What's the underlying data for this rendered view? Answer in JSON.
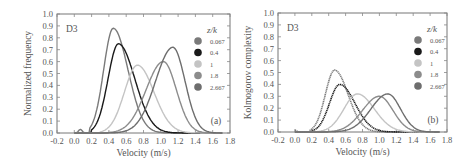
{
  "figure": {
    "panels_count": 2
  },
  "chart_data": [
    {
      "type": "line",
      "panel_label": "(a)",
      "annotation": "D3",
      "title": "",
      "xlabel": "Velocity (m/s)",
      "ylabel": "Normalized frequency",
      "xlim": [
        -0.2,
        1.8
      ],
      "ylim": [
        0.0,
        1.0
      ],
      "xticks": [
        "-0.2",
        "0.0",
        "0.2",
        "0.4",
        "0.6",
        "0.8",
        "1.0",
        "1.2",
        "1.4",
        "1.6",
        "1.8"
      ],
      "yticks": [
        "0.0",
        "0.1",
        "0.2",
        "0.3",
        "0.4",
        "0.5",
        "0.6",
        "0.7",
        "0.8",
        "0.9",
        "1.0"
      ],
      "grid": false,
      "legend_title": "z/k",
      "legend_position": "upper right",
      "series": [
        {
          "name": "0.067",
          "color": "#7a7a7a",
          "peak_x": 0.45,
          "peak_y": 0.88,
          "sigma_left": 0.11,
          "sigma_right": 0.17,
          "start_x": 0.18
        },
        {
          "name": "0.4",
          "color": "#1a1a1a",
          "peak_x": 0.51,
          "peak_y": 0.75,
          "sigma_left": 0.12,
          "sigma_right": 0.19,
          "start_x": 0.2
        },
        {
          "name": "1",
          "color": "#c4c4c4",
          "peak_x": 0.73,
          "peak_y": 0.57,
          "sigma_left": 0.15,
          "sigma_right": 0.19,
          "start_x": 0.3
        },
        {
          "name": "1.8",
          "color": "#8c8c8c",
          "peak_x": 1.03,
          "peak_y": 0.6,
          "sigma_left": 0.2,
          "sigma_right": 0.15,
          "start_x": 0.35
        },
        {
          "name": "2.667",
          "color": "#6e6e6e",
          "peak_x": 1.14,
          "peak_y": 0.72,
          "sigma_left": 0.2,
          "sigma_right": 0.14,
          "start_x": 0.4
        }
      ],
      "small_bump": {
        "x": 0.07,
        "y": 0.03
      }
    },
    {
      "type": "line",
      "panel_label": "(b)",
      "annotation": "D3",
      "title": "",
      "xlabel": "Velocity (m/s)",
      "ylabel": "Kolmogorov complexity",
      "xlim": [
        -0.2,
        1.8
      ],
      "ylim": [
        0.0,
        1.0
      ],
      "xticks": [
        "-0.2",
        "0.0",
        "0.2",
        "0.4",
        "0.6",
        "0.8",
        "1.0",
        "1.2",
        "1.4",
        "1.6",
        "1.8"
      ],
      "yticks": [
        "0.0",
        "0.1",
        "0.2",
        "0.3",
        "0.4",
        "0.5",
        "0.6",
        "0.7",
        "0.8",
        "0.9",
        "1.0"
      ],
      "grid": false,
      "legend_title": "z/k",
      "legend_position": "upper right",
      "series": [
        {
          "name": "0.067",
          "color": "#7a7a7a",
          "peak_x": 0.47,
          "peak_y": 0.52,
          "sigma_left": 0.11,
          "sigma_right": 0.16,
          "start_x": 0.18
        },
        {
          "name": "0.4",
          "color": "#1a1a1a",
          "peak_x": 0.53,
          "peak_y": 0.4,
          "sigma_left": 0.12,
          "sigma_right": 0.18,
          "start_x": 0.2
        },
        {
          "name": "1",
          "color": "#c4c4c4",
          "peak_x": 0.74,
          "peak_y": 0.32,
          "sigma_left": 0.16,
          "sigma_right": 0.2,
          "start_x": 0.25
        },
        {
          "name": "1.8",
          "color": "#8c8c8c",
          "peak_x": 1.0,
          "peak_y": 0.3,
          "sigma_left": 0.2,
          "sigma_right": 0.16,
          "start_x": 0.35
        },
        {
          "name": "2.667",
          "color": "#6e6e6e",
          "peak_x": 1.1,
          "peak_y": 0.32,
          "sigma_left": 0.2,
          "sigma_right": 0.15,
          "start_x": 0.4
        }
      ],
      "small_bump": {
        "x": 0.0,
        "y": 0.015
      }
    }
  ]
}
